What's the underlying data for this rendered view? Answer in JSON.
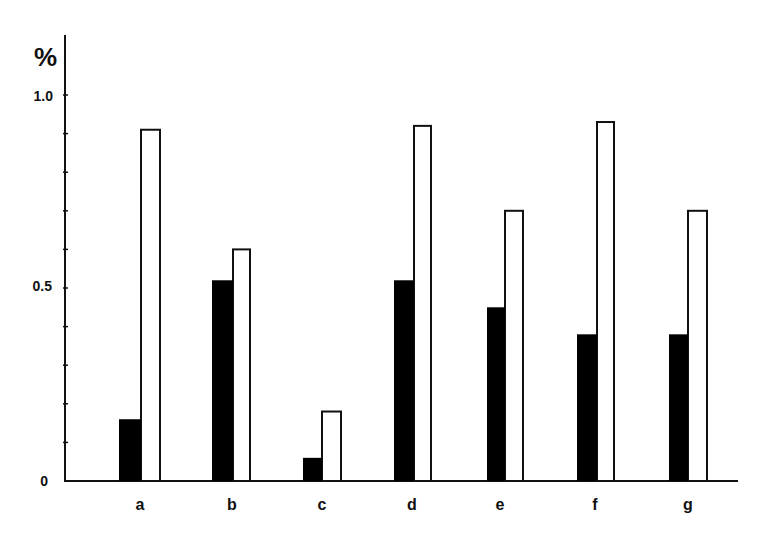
{
  "chart_data": {
    "type": "bar",
    "title": "",
    "xlabel": "",
    "ylabel": "%",
    "ylim": [
      0,
      1.1
    ],
    "yticks": [
      0,
      0.5,
      1.0
    ],
    "ytick_labels": [
      "0",
      "0.5",
      "1.0"
    ],
    "minor_tick_step": 0.1,
    "grid": false,
    "legend": null,
    "categories": [
      "a",
      "b",
      "c",
      "d",
      "e",
      "f",
      "g"
    ],
    "series": [
      {
        "name": "filled (black)",
        "color": "#000000",
        "values": [
          0.16,
          0.52,
          0.06,
          0.52,
          0.45,
          0.38,
          0.38
        ]
      },
      {
        "name": "open (white)",
        "color": "#ffffff",
        "values": [
          0.91,
          0.6,
          0.18,
          0.92,
          0.7,
          0.93,
          0.7
        ]
      }
    ]
  },
  "axis": {
    "y_unit": "%",
    "y_labels": {
      "zero": "0",
      "half": "0.5",
      "one": "1.0"
    }
  },
  "categories": {
    "a": "a",
    "b": "b",
    "c": "c",
    "d": "d",
    "e": "e",
    "f": "f",
    "g": "g"
  }
}
